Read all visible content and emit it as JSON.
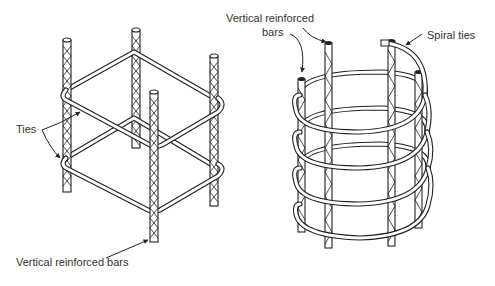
{
  "figure": {
    "left_diagram": {
      "name": "tied-column",
      "labels": {
        "ties": "Ties",
        "vertical_bars": "Vertical reinforced bars"
      }
    },
    "right_diagram": {
      "name": "spiral-column",
      "labels": {
        "vertical_bars_line1": "Vertical reinforced",
        "vertical_bars_line2": "bars",
        "spiral_ties": "Spiral ties"
      }
    },
    "colors": {
      "line": "#222222",
      "text": "#333333",
      "background": "#ffffff"
    }
  }
}
